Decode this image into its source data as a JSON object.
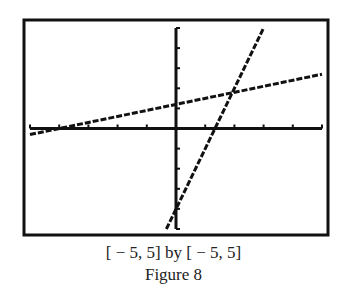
{
  "chart_data": {
    "type": "line",
    "title": "",
    "xlabel": "",
    "ylabel": "",
    "xlim": [
      -5,
      5
    ],
    "ylim": [
      -5,
      5
    ],
    "xscale": 1,
    "yscale": 1,
    "grid": false,
    "legend": null,
    "style": "graphing-calculator screen, dotted/pixelated lines",
    "series": [
      {
        "name": "line-1",
        "slope": 0.3,
        "intercept": 1.2,
        "x": [
          -5,
          5
        ],
        "y": [
          -0.3,
          2.7
        ]
      },
      {
        "name": "line-2",
        "slope": 3,
        "intercept": -4,
        "x": [
          -0.33,
          3
        ],
        "y": [
          -5,
          5
        ]
      }
    ],
    "intersection": {
      "x": 1.9,
      "y": 1.8
    }
  },
  "caption": {
    "window": "[ − 5, 5] by [ − 5, 5]",
    "figure": "Figure 8"
  }
}
